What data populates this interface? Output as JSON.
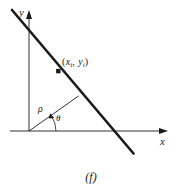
{
  "figure": {
    "caption": "(f)",
    "caption_letter": "f",
    "background_color": "#ffffff",
    "stroke_color": "#1a1a1a",
    "width": 182,
    "height": 196
  },
  "axes": {
    "x_label": "x",
    "y_label": "y",
    "origin": {
      "x": 29,
      "y": 131
    },
    "x_axis": {
      "x1": 10,
      "y1": 131,
      "x2": 168,
      "y2": 131,
      "arrow": "right"
    },
    "y_axis": {
      "x1": 29,
      "y1": 131,
      "x2": 29,
      "y2": 13,
      "arrow": "up"
    }
  },
  "line": {
    "name": "parameterized-line",
    "x1": 12,
    "y1": 10,
    "x2": 133,
    "y2": 153,
    "stroke_width": 2.6,
    "x_intercept": {
      "x": 118,
      "y": 131
    }
  },
  "point": {
    "label_full": "(xi, yi)",
    "label_x": "x",
    "label_y": "y",
    "subscript": "i",
    "comma": ", ",
    "open_paren": "(",
    "close_paren": ")",
    "marker": {
      "x": 58,
      "y": 71,
      "size": 4
    }
  },
  "rho": {
    "symbol": "ρ",
    "name": "perpendicular-distance",
    "x1": 29,
    "y1": 131,
    "x2": 78,
    "y2": 96,
    "stroke_width": 0.9
  },
  "theta": {
    "symbol": "θ",
    "name": "angle-from-x-axis",
    "arc_radius": 27,
    "vertex": {
      "x": 29,
      "y": 131
    },
    "start_deg": 0,
    "end_deg": 35.5
  }
}
